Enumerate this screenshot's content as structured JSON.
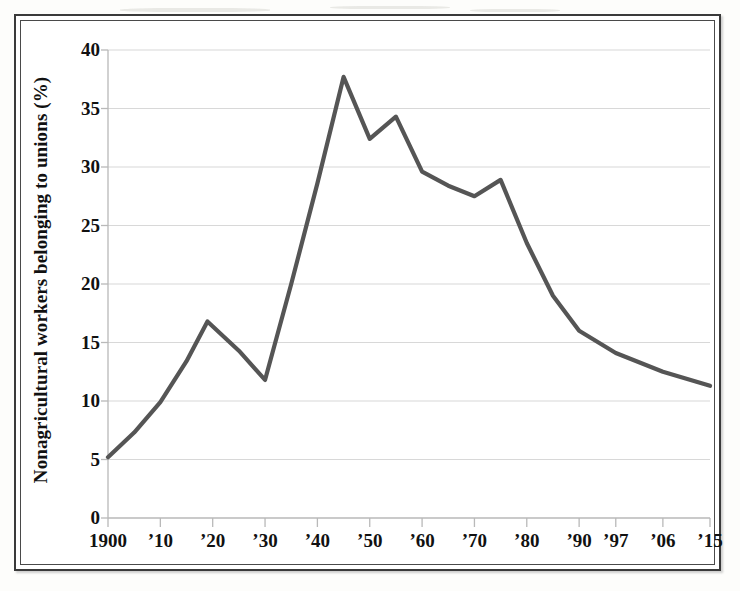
{
  "figure": {
    "frame_style": "double-rule-box",
    "background_color": "#ffffff",
    "line_color": "#555555",
    "grid_color": "#d8d8d8",
    "axis_color": "#b9b9b9",
    "text_color": "#111111"
  },
  "chart_data": {
    "type": "line",
    "title": "",
    "subtitle": "",
    "xlabel": "",
    "ylabel": "Nonagricultural workers belonging to unions (%)",
    "ylim": [
      0,
      40
    ],
    "ytick_values": [
      0,
      5,
      10,
      15,
      20,
      25,
      30,
      35,
      40
    ],
    "ytick_labels": [
      "0",
      "5",
      "10",
      "15",
      "20",
      "25",
      "30",
      "35",
      "40"
    ],
    "grid": "horizontal",
    "legend": "none",
    "x_axis_note": "category axis with uneven final intervals",
    "xtick_labels": [
      "1900",
      "’10",
      "’20",
      "’30",
      "’40",
      "’50",
      "’60",
      "’70",
      "’80",
      "’90",
      "’97",
      "’06",
      "’15"
    ],
    "x_positions": [
      0,
      10,
      20,
      30,
      40,
      50,
      60,
      70,
      80,
      90,
      97,
      106,
      115
    ],
    "series": [
      {
        "name": "Union membership share",
        "color": "#555555",
        "x": [
          0,
          5,
          10,
          15,
          19,
          25,
          30,
          35,
          40,
          45,
          50,
          55,
          60,
          65,
          70,
          75,
          80,
          85,
          90,
          97,
          106,
          115
        ],
        "x_labels": [
          "1900",
          "1905",
          "1910",
          "1915",
          "1919",
          "1925",
          "1930",
          "1935",
          "1940",
          "1945",
          "1950",
          "1955",
          "1960",
          "1965",
          "1970",
          "1975",
          "1980",
          "1985",
          "1990",
          "1997",
          "2006",
          "2015"
        ],
        "values": [
          5.2,
          7.3,
          9.9,
          13.4,
          16.8,
          14.3,
          11.8,
          20.0,
          28.6,
          37.7,
          32.4,
          34.3,
          29.6,
          28.4,
          27.5,
          28.9,
          23.5,
          19.0,
          16.0,
          14.1,
          12.5,
          11.3
        ]
      }
    ]
  },
  "axes": {
    "y_ticks": [
      {
        "label": "40",
        "value": 40
      },
      {
        "label": "35",
        "value": 35
      },
      {
        "label": "30",
        "value": 30
      },
      {
        "label": "25",
        "value": 25
      },
      {
        "label": "20",
        "value": 20
      },
      {
        "label": "15",
        "value": 15
      },
      {
        "label": "10",
        "value": 10
      },
      {
        "label": "5",
        "value": 5
      },
      {
        "label": "0",
        "value": 0
      }
    ],
    "x_ticks": [
      {
        "label": "1900",
        "pos": 0
      },
      {
        "label": "’10",
        "pos": 10
      },
      {
        "label": "’20",
        "pos": 20
      },
      {
        "label": "’30",
        "pos": 30
      },
      {
        "label": "’40",
        "pos": 40
      },
      {
        "label": "’50",
        "pos": 50
      },
      {
        "label": "’60",
        "pos": 60
      },
      {
        "label": "’70",
        "pos": 70
      },
      {
        "label": "’80",
        "pos": 80
      },
      {
        "label": "’90",
        "pos": 90
      },
      {
        "label": "’97",
        "pos": 97
      },
      {
        "label": "’06",
        "pos": 106
      },
      {
        "label": "’15",
        "pos": 115
      }
    ]
  }
}
